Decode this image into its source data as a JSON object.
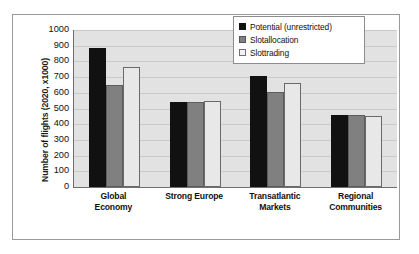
{
  "chart_data": {
    "type": "bar",
    "title": "",
    "xlabel": "",
    "ylabel": "Number of flights (2020, x1000)",
    "ylim": [
      0,
      1000
    ],
    "yticks": [
      "1000",
      "900",
      "800",
      "700",
      "600",
      "500",
      "400",
      "300",
      "200",
      "100",
      "0"
    ],
    "grid": true,
    "legend_position": "top-right",
    "categories": [
      "Global Economy",
      "Strong Europe",
      "Transatlantic Markets",
      "Regional Communities"
    ],
    "categories_lines": [
      [
        "Global",
        "Economy"
      ],
      [
        "Strong Europe",
        ""
      ],
      [
        "Transatlantic",
        "Markets"
      ],
      [
        "Regional",
        "Communities"
      ]
    ],
    "series": [
      {
        "name": "Potential (unrestricted)",
        "color": "#111111",
        "values": [
          885,
          540,
          705,
          460
        ]
      },
      {
        "name": "Slotallocation",
        "color": "#808080",
        "values": [
          650,
          540,
          605,
          460
        ]
      },
      {
        "name": "Slottrading",
        "color": "#e8e8e8",
        "values": [
          765,
          545,
          665,
          455
        ]
      }
    ]
  },
  "legend": {
    "items": [
      {
        "label": "Potential (unrestricted)"
      },
      {
        "label": "Slotallocation"
      },
      {
        "label": "Slottrading"
      }
    ]
  },
  "colors": {
    "plot_background": "#e2e2e2",
    "gridline": "#c9c9c9",
    "axis": "#6f6f6f",
    "frame": "#9a9a9a",
    "text": "#111111"
  }
}
